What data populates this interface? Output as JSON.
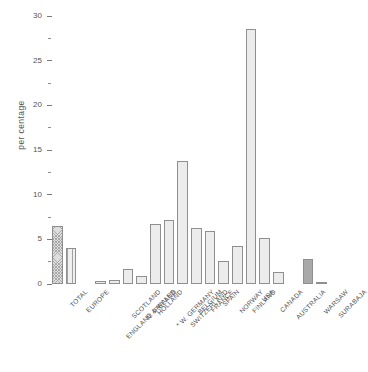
{
  "chart_data": {
    "type": "bar",
    "title": "",
    "subtitle": "",
    "xlabel": "",
    "ylabel": "per centage",
    "ylim": [
      0,
      30
    ],
    "grid": false,
    "legend": null,
    "y_major_ticks": [
      0,
      5,
      10,
      15,
      20,
      25,
      30
    ],
    "y_minor_ticks": [
      2.5,
      7.5,
      12.5,
      17.5,
      22.5,
      27.5
    ],
    "y_tick_labels": [
      "0",
      "5",
      "10",
      "15",
      "20",
      "25",
      "30"
    ],
    "categories": [
      "TOTAL",
      "EUROPE",
      "ENGLAND & WALES",
      "SCOTLAND",
      "N. IRELAND",
      "HOLLAND",
      "W. GERMANY",
      "SWITZERLAND",
      "BELGIUM",
      "FRANCE",
      "SPAIN",
      "NORWAY",
      "FINLAND",
      "USA",
      "CANADA",
      "AUSTRALIA",
      "WARSAW",
      "SURABAJA"
    ],
    "values": [
      6.5,
      4.0,
      0.3,
      0.4,
      1.7,
      0.9,
      6.7,
      7.2,
      13.8,
      6.3,
      5.9,
      2.6,
      4.2,
      28.5,
      5.2,
      1.4,
      2.8,
      0.2
    ],
    "bar_fills": [
      "cross",
      "vstripe",
      "stipple",
      "stipple",
      "stipple",
      "stipple",
      "stipple",
      "stipple",
      "stipple",
      "stipple",
      "stipple",
      "stipple",
      "stipple",
      "stipple",
      "stipple",
      "stipple",
      "solid",
      "solid"
    ],
    "annotations": [
      "W. GERMANY label is prefixed with an asterisk"
    ],
    "group_gap_after": [
      1,
      15
    ],
    "colors": {
      "bar_fill": "#ececec",
      "bar_edge": "#8f8f8f",
      "solid_fill": "#a9a9a9",
      "axis": "#7a7a7a",
      "text": "#4f4f4f"
    }
  }
}
